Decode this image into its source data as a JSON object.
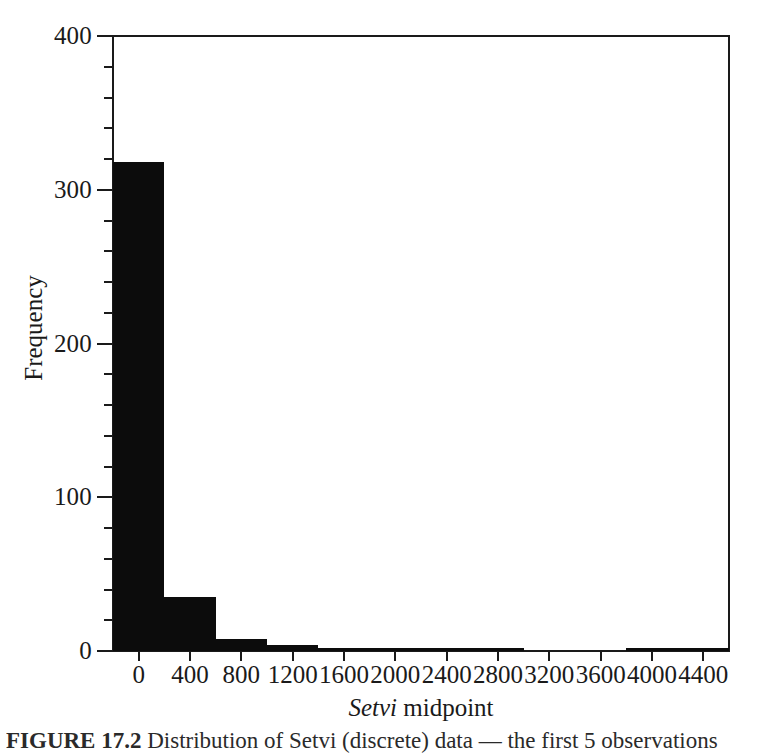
{
  "figure": {
    "background_color": "#ffffff",
    "bar_color": "#0c0c0c",
    "axis_color": "#1a1a1a"
  },
  "axes": {
    "y_title": "Frequency",
    "x_title_italic": "Setvi",
    "x_title_rest": " midpoint",
    "y_tick_labels": [
      "400",
      "300",
      "200",
      "100",
      "0"
    ],
    "x_tick_labels": [
      "0",
      "400",
      "800",
      "1200",
      "1600",
      "2000",
      "2400",
      "2800",
      "3200",
      "3600",
      "4000",
      "4400"
    ]
  },
  "caption": {
    "label": "FIGURE 17.2",
    "text": "Distribution of Setvi (discrete) data — the first 5 observations"
  },
  "chart_data": {
    "type": "bar",
    "title": "",
    "xlabel": "Setvi midpoint",
    "ylabel": "Frequency",
    "categories": [
      "0",
      "400",
      "800",
      "1200",
      "1600",
      "2000",
      "2400",
      "2800",
      "3200",
      "3600",
      "4000",
      "4400"
    ],
    "values": [
      318,
      35,
      8,
      4,
      1,
      2,
      2,
      1,
      0,
      0,
      2,
      2
    ],
    "xlim": [
      -200,
      4600
    ],
    "ylim": [
      0,
      400
    ],
    "y_major_ticks": [
      0,
      100,
      200,
      300,
      400
    ],
    "y_minor_tick_interval": 20,
    "x_tick_interval": 400,
    "grid": false,
    "legend": false,
    "bar_width_units": 400
  }
}
